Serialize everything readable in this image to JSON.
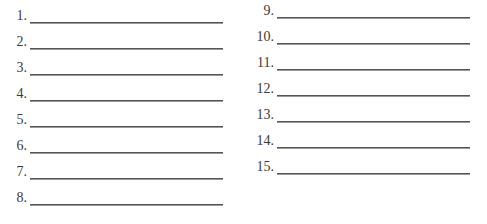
{
  "left_column": {
    "items": [
      {
        "label": "1.",
        "value": ""
      },
      {
        "label": "2.",
        "value": ""
      },
      {
        "label": "3.",
        "value": ""
      },
      {
        "label": "4.",
        "value": ""
      },
      {
        "label": "5.",
        "value": ""
      },
      {
        "label": "6.",
        "value": ""
      },
      {
        "label": "7.",
        "value": ""
      },
      {
        "label": "8.",
        "value": ""
      }
    ]
  },
  "right_column": {
    "items": [
      {
        "label": "9.",
        "value": ""
      },
      {
        "label": "10.",
        "value": ""
      },
      {
        "label": "11.",
        "value": ""
      },
      {
        "label": "12.",
        "value": ""
      },
      {
        "label": "13.",
        "value": ""
      },
      {
        "label": "14.",
        "value": ""
      },
      {
        "label": "15.",
        "value": ""
      }
    ]
  }
}
